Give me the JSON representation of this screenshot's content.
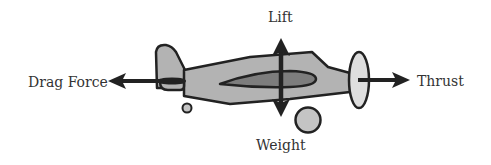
{
  "diagram": {
    "labels": {
      "lift": "Lift",
      "weight": "Weight",
      "drag": "Drag Force",
      "thrust": "Thrust"
    },
    "colors": {
      "outline": "#222222",
      "fuselage_fill": "#b3b3b3",
      "wing_fill": "#7d7d7d",
      "propeller_fill": "#dedede",
      "wheel_fill": "#c4c4c4",
      "arrow": "#222222",
      "text": "#333333",
      "background": "#ffffff"
    },
    "forces": [
      {
        "name": "Lift",
        "direction": "up"
      },
      {
        "name": "Weight",
        "direction": "down"
      },
      {
        "name": "Drag Force",
        "direction": "left"
      },
      {
        "name": "Thrust",
        "direction": "right"
      }
    ]
  }
}
